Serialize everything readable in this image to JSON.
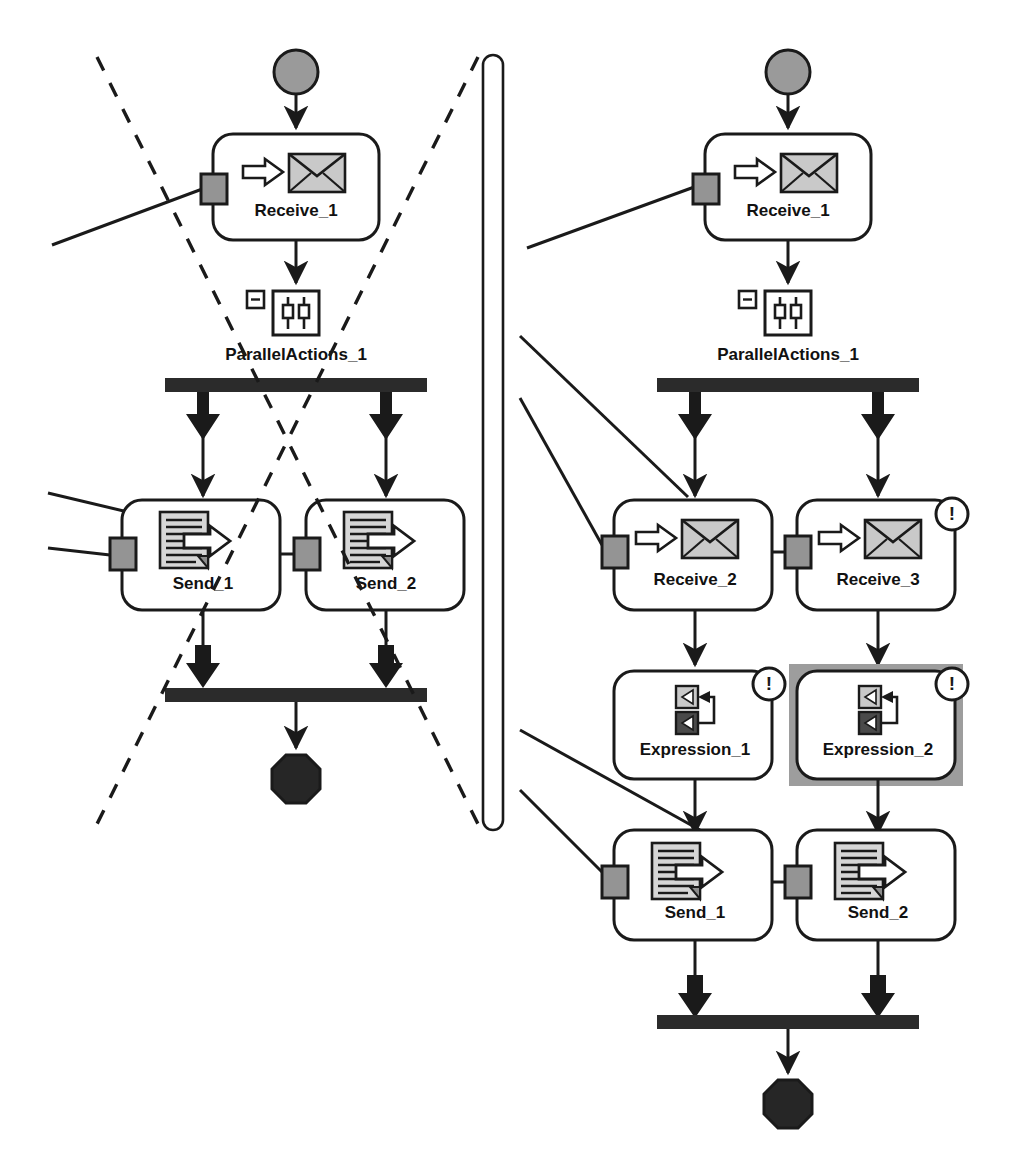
{
  "diagram": {
    "colors": {
      "stroke": "#1a1a1a",
      "port_fill": "#949494",
      "start_fill": "#9a9a9a",
      "end_fill": "#262626",
      "bar_fill": "#2b2b2b",
      "icon_light": "#c9c9c9",
      "icon_mid": "#8c8c8c",
      "icon_dark": "#4a4a4a",
      "selection_fill": "#9d9d9d",
      "node_fill": "#ffffff",
      "badge_fill": "#ffffff"
    },
    "divider": {
      "name": "panel-divider",
      "shape": "rounded-pill"
    },
    "left_panel": {
      "name": "left-workflow-panel",
      "crossed_out": true,
      "cross_marker": "dashed-x",
      "start_node": {
        "label": "",
        "icon": "start-circle-icon"
      },
      "end_node": {
        "label": "",
        "icon": "end-octagon-icon"
      },
      "nodes": [
        {
          "id": "l-receive-1",
          "label": "Receive_1",
          "icon": "receive-message-icon",
          "warning": false,
          "selected": false
        },
        {
          "id": "l-parallel-1",
          "label": "ParallelActions_1",
          "icon": "parallel-actions-icon",
          "collapse": "minus",
          "warning": false,
          "selected": false
        },
        {
          "id": "l-send-1",
          "label": "Send_1",
          "icon": "send-message-icon",
          "warning": false,
          "selected": false
        },
        {
          "id": "l-send-2",
          "label": "Send_2",
          "icon": "send-message-icon",
          "warning": false,
          "selected": false
        }
      ]
    },
    "right_panel": {
      "name": "right-workflow-panel",
      "crossed_out": false,
      "start_node": {
        "label": "",
        "icon": "start-circle-icon"
      },
      "end_node": {
        "label": "",
        "icon": "end-octagon-icon"
      },
      "nodes": [
        {
          "id": "r-receive-1",
          "label": "Receive_1",
          "icon": "receive-message-icon",
          "warning": false,
          "selected": false
        },
        {
          "id": "r-parallel-1",
          "label": "ParallelActions_1",
          "icon": "parallel-actions-icon",
          "collapse": "minus",
          "warning": false,
          "selected": false
        },
        {
          "id": "r-receive-2",
          "label": "Receive_2",
          "icon": "receive-message-icon",
          "warning": false,
          "selected": false
        },
        {
          "id": "r-receive-3",
          "label": "Receive_3",
          "icon": "receive-message-icon",
          "warning": true,
          "selected": false
        },
        {
          "id": "r-expression-1",
          "label": "Expression_1",
          "icon": "expression-icon",
          "warning": true,
          "selected": false
        },
        {
          "id": "r-expression-2",
          "label": "Expression_2",
          "icon": "expression-icon",
          "warning": true,
          "selected": true
        },
        {
          "id": "r-send-1",
          "label": "Send_1",
          "icon": "send-message-icon",
          "warning": false,
          "selected": false
        },
        {
          "id": "r-send-2",
          "label": "Send_2",
          "icon": "send-message-icon",
          "warning": false,
          "selected": false
        }
      ]
    },
    "labels": {
      "l_receive_1": "Receive_1",
      "l_parallel_1": "ParallelActions_1",
      "l_send_1": "Send_1",
      "l_send_2": "Send_2",
      "r_receive_1": "Receive_1",
      "r_parallel_1": "ParallelActions_1",
      "r_receive_2": "Receive_2",
      "r_receive_3": "Receive_3",
      "r_expression_1": "Expression_1",
      "r_expression_2": "Expression_2",
      "r_send_1": "Send_1",
      "r_send_2": "Send_2"
    },
    "badge": {
      "glyph": "!",
      "name": "warning-badge"
    },
    "collapse_glyph": "−"
  }
}
